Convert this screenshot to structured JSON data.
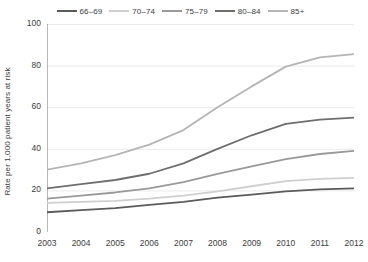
{
  "chart_data": {
    "type": "line",
    "title": "",
    "xlabel": "",
    "ylabel": "Rate per 1,000 patient years at risk",
    "x": [
      2003,
      2004,
      2005,
      2006,
      2007,
      2008,
      2009,
      2010,
      2011,
      2012
    ],
    "xtick_labels": [
      "2003",
      "2004",
      "2005",
      "2006",
      "2007",
      "2008",
      "2009",
      "2010",
      "2011",
      "2012"
    ],
    "ytick_labels": [
      "0",
      "20",
      "40",
      "60",
      "80",
      "100"
    ],
    "yticks": [
      0,
      20,
      40,
      60,
      80,
      100
    ],
    "ylim": [
      0,
      100
    ],
    "xlim": [
      2003,
      2012
    ],
    "grid": "horizontal",
    "legend_position": "top-center",
    "series": [
      {
        "name": "66-69",
        "color": "#5a5a5a",
        "values": [
          9.5,
          10.5,
          11.5,
          13.0,
          14.5,
          16.5,
          18.0,
          19.5,
          20.5,
          21.0
        ]
      },
      {
        "name": "70-74",
        "color": "#cfcfcf",
        "values": [
          14.0,
          14.5,
          15.0,
          16.0,
          17.5,
          19.5,
          22.0,
          24.5,
          25.5,
          26.0
        ]
      },
      {
        "name": "75-79",
        "color": "#999999",
        "values": [
          16.0,
          17.5,
          19.0,
          21.0,
          24.0,
          28.0,
          31.5,
          35.0,
          37.5,
          39.0
        ]
      },
      {
        "name": "80-84",
        "color": "#6e6e6e",
        "values": [
          21.0,
          23.0,
          25.0,
          28.0,
          33.0,
          40.0,
          46.5,
          52.0,
          54.0,
          55.0
        ]
      },
      {
        "name": "85+",
        "color": "#b5b5b5",
        "values": [
          30.0,
          33.0,
          37.0,
          42.0,
          49.0,
          60.0,
          70.0,
          79.5,
          84.0,
          85.5
        ]
      }
    ]
  },
  "legend": {
    "items": [
      {
        "label": "66–69",
        "color": "#5a5a5a"
      },
      {
        "label": "70–74",
        "color": "#cfcfcf"
      },
      {
        "label": "75–79",
        "color": "#999999"
      },
      {
        "label": "80–84",
        "color": "#6e6e6e"
      },
      {
        "label": "85+",
        "color": "#b5b5b5"
      }
    ]
  },
  "axes": {
    "y_title": "Rate per 1,000 patient years at risk",
    "axis_color": "#b9b9b9",
    "grid_color": "#ebebeb",
    "tick_color": "#9a9a9a"
  }
}
